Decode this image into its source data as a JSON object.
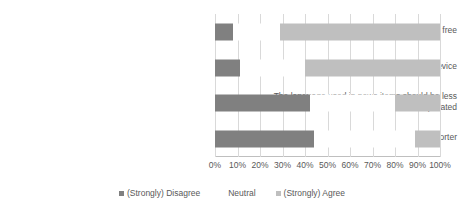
{
  "chart_data": {
    "type": "bar",
    "subtype": "100% stacked horizontal bar",
    "title": "",
    "subtitle": "",
    "xlabel": "",
    "ylabel": "",
    "xlim": [
      0,
      100
    ],
    "grid": true,
    "legend_position": "bottom",
    "categories": [
      "News should always be for free",
      "News should always be available on a mobile device",
      "The language used in news items should be less complicated",
      "News items (word or image) should be shorter"
    ],
    "xticks": [
      0,
      10,
      20,
      30,
      40,
      50,
      60,
      70,
      80,
      90,
      100
    ],
    "xticklabels": [
      "0%",
      "10%",
      "20%",
      "30%",
      "40%",
      "50%",
      "60%",
      "70%",
      "80%",
      "90%",
      "100%"
    ],
    "series": [
      {
        "name": "(Strongly) Disagree",
        "color": "#808080",
        "values": [
          8,
          11,
          42,
          44
        ]
      },
      {
        "name": "Neutral",
        "color": "#ffffff",
        "values": [
          21,
          29,
          38,
          45
        ]
      },
      {
        "name": "(Strongly) Agree",
        "color": "#bfbfbf",
        "values": [
          71,
          60,
          20,
          11
        ]
      }
    ]
  },
  "legend": {
    "items": [
      {
        "label": "(Strongly) Disagree",
        "color": "#808080"
      },
      {
        "label": "Neutral",
        "color": "#ffffff"
      },
      {
        "label": "(Strongly) Agree",
        "color": "#bfbfbf"
      }
    ]
  }
}
